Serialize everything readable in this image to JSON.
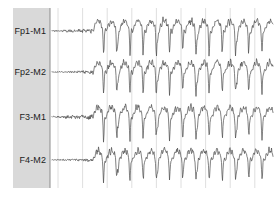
{
  "view": {
    "title": "EEG Trace Viewer",
    "width": 278,
    "height": 199,
    "background": "#ffffff"
  },
  "label_panel": {
    "name": "channel-label-panel",
    "x": 13,
    "y": 8,
    "width": 37,
    "height": 180,
    "fill": "#d9d9d9",
    "border_color": "#8d8d8d"
  },
  "grid": {
    "visible": true,
    "color": "#d6d6d6",
    "first_x": 58,
    "spacing": 24.6,
    "count": 9,
    "top": 8,
    "bottom": 188
  },
  "trace_style": {
    "color": "#4a4a4a",
    "width": 0.7
  },
  "channels": [
    {
      "label": "Fp1-M1",
      "label_x": 46,
      "label_y": 34,
      "baseline": 31
    },
    {
      "label": "Fp2-M2",
      "label_x": 46,
      "label_y": 75,
      "baseline": 72
    },
    {
      "label": "F3-M1",
      "label_x": 46,
      "label_y": 120,
      "baseline": 117
    },
    {
      "label": "F4-M2",
      "label_x": 46,
      "label_y": 163,
      "baseline": 160
    }
  ],
  "chart_data": {
    "type": "line",
    "xlabel": "",
    "ylabel": "",
    "grid": true,
    "legend_position": "left",
    "x_start": 52,
    "x_end": 273,
    "onset_x": 93,
    "series": [
      {
        "name": "Fp1-M1",
        "baseline": 31,
        "amplitude": 20,
        "pre_amplitude": 1.6,
        "seed": 11
      },
      {
        "name": "Fp2-M2",
        "baseline": 72,
        "amplitude": 19,
        "pre_amplitude": 1.1,
        "seed": 23
      },
      {
        "name": "F3-M1",
        "baseline": 117,
        "amplitude": 19,
        "pre_amplitude": 1.9,
        "seed": 37
      },
      {
        "name": "F4-M2",
        "baseline": 160,
        "amplitude": 19,
        "pre_amplitude": 1.2,
        "seed": 53
      }
    ],
    "burst_pattern": {
      "description": "generalized rhythmic spike-and-wave discharges",
      "period": 13.2,
      "spike_width": 2.2
    }
  }
}
